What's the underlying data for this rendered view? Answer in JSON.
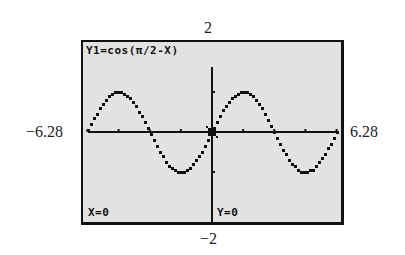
{
  "window": {
    "xmin_label": "−6.28",
    "xmax_label": "6.28",
    "ymax_label": "2",
    "ymin_label": "−2"
  },
  "screen": {
    "equation": "Y1=cos(π/2-X)",
    "x_readout": "X=0",
    "y_readout": "Y=0"
  },
  "colors": {
    "screen_bg": "#e2e2e2",
    "ink": "#111111"
  },
  "chart_data": {
    "type": "line",
    "title": "Y1=cos(π/2-X)",
    "function": "cos(pi/2 - x)",
    "xlabel": "",
    "ylabel": "",
    "xlim": [
      -6.28,
      6.28
    ],
    "ylim": [
      -2,
      2
    ],
    "x_tick_spacing": 1.5708,
    "y_tick_spacing": 1,
    "grid": false,
    "trace_cursor": {
      "x": 0,
      "y": 0
    },
    "series": [
      {
        "name": "Y1",
        "x": [
          -6.28,
          -5.5,
          -4.71,
          -3.93,
          -3.14,
          -2.36,
          -1.57,
          -0.79,
          0,
          0.79,
          1.57,
          2.36,
          3.14,
          3.93,
          4.71,
          5.5,
          6.28
        ],
        "values": [
          0,
          0.71,
          1,
          0.71,
          0,
          -0.71,
          -1,
          -0.71,
          0,
          0.71,
          1,
          0.71,
          0,
          -0.71,
          -1,
          -0.71,
          0
        ]
      }
    ]
  }
}
